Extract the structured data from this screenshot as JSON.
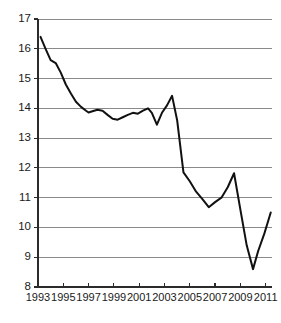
{
  "chart_data": {
    "type": "line",
    "title": "",
    "subtitle": "",
    "xlabel": "",
    "ylabel": "",
    "xlim": [
      1993,
      2011.5
    ],
    "ylim": [
      8,
      17
    ],
    "grid": true,
    "legend": "none",
    "y_ticks": [
      8,
      9,
      10,
      11,
      12,
      13,
      14,
      15,
      16,
      17
    ],
    "y_tick_labels": [
      "8",
      "9",
      "10",
      "11",
      "12",
      "13",
      "14",
      "15",
      "16",
      "17"
    ],
    "x_ticks": [
      1993,
      1995,
      1997,
      1999,
      2001,
      2003,
      2005,
      2007,
      2009,
      2011
    ],
    "x_tick_labels": [
      "1993",
      "1995",
      "1997",
      "1999",
      "2001",
      "2003",
      "2005",
      "2007",
      "2009",
      "2011"
    ],
    "series": [
      {
        "name": "series-1",
        "color": "#111111",
        "x": [
          1993.2,
          1993.6,
          1994.0,
          1994.4,
          1994.8,
          1995.2,
          1995.6,
          1996.0,
          1996.4,
          1996.8,
          1997.0,
          1997.3,
          1997.7,
          1998.1,
          1998.5,
          1998.9,
          1999.3,
          1999.7,
          2000.1,
          2000.5,
          2000.9,
          2001.3,
          2001.7,
          2002.0,
          2002.4,
          2002.8,
          2003.2,
          2003.6,
          2004.0,
          2004.5,
          2005.0,
          2005.5,
          2006.0,
          2006.5,
          2007.0,
          2007.5,
          2008.0,
          2008.5,
          2009.0,
          2009.5,
          2010.0,
          2010.4,
          2010.9,
          2011.4
        ],
        "values": [
          16.4,
          16.0,
          15.62,
          15.52,
          15.2,
          14.8,
          14.5,
          14.22,
          14.05,
          13.92,
          13.86,
          13.9,
          13.95,
          13.92,
          13.78,
          13.65,
          13.62,
          13.7,
          13.78,
          13.85,
          13.82,
          13.92,
          14.0,
          13.85,
          13.45,
          13.85,
          14.1,
          14.42,
          13.6,
          11.85,
          11.55,
          11.2,
          10.95,
          10.68,
          10.85,
          11.0,
          11.35,
          11.82,
          10.6,
          9.4,
          8.6,
          9.2,
          9.8,
          10.5
        ]
      }
    ]
  },
  "axes": {
    "y_axis_name": "y-axis",
    "x_axis_name": "x-axis"
  }
}
